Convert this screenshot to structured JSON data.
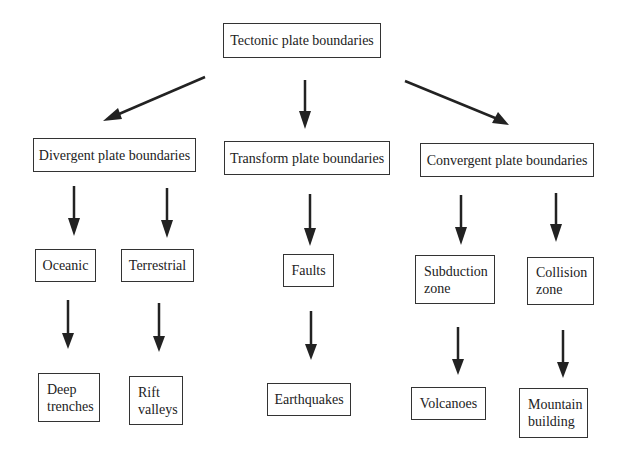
{
  "diagram": {
    "root": {
      "label": "Tectonic plate boundaries"
    },
    "categories": [
      {
        "label": "Divergent plate boundaries"
      },
      {
        "label": "Transform plate boundaries"
      },
      {
        "label": "Convergent plate boundaries"
      }
    ],
    "subtypes": [
      {
        "label": "Oceanic"
      },
      {
        "label": "Terrestrial"
      },
      {
        "label": "Faults"
      },
      {
        "label": "Subduction\nzone"
      },
      {
        "label": "Collision\nzone"
      }
    ],
    "results": [
      {
        "label": "Deep\ntrenches"
      },
      {
        "label": "Rift\nvalleys"
      },
      {
        "label": "Earthquakes"
      },
      {
        "label": "Volcanoes"
      },
      {
        "label": "Mountain\nbuilding"
      }
    ],
    "colors": {
      "line": "#222222",
      "background": "#ffffff"
    }
  }
}
